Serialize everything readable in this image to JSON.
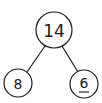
{
  "diagram": {
    "type": "number-bond",
    "whole": {
      "value": "14",
      "cx": 54,
      "cy": 30,
      "r": 18
    },
    "parts": [
      {
        "value": "8",
        "cx": 18,
        "cy": 83,
        "r": 14,
        "underlined": false
      },
      {
        "value": "6",
        "cx": 84,
        "cy": 84,
        "r": 14,
        "underlined": true
      }
    ],
    "edges": [
      {
        "from": "whole",
        "to": "part-0"
      },
      {
        "from": "whole",
        "to": "part-1"
      }
    ],
    "colors": {
      "stroke": "#1a1a1a",
      "background": "#ffffff"
    }
  }
}
